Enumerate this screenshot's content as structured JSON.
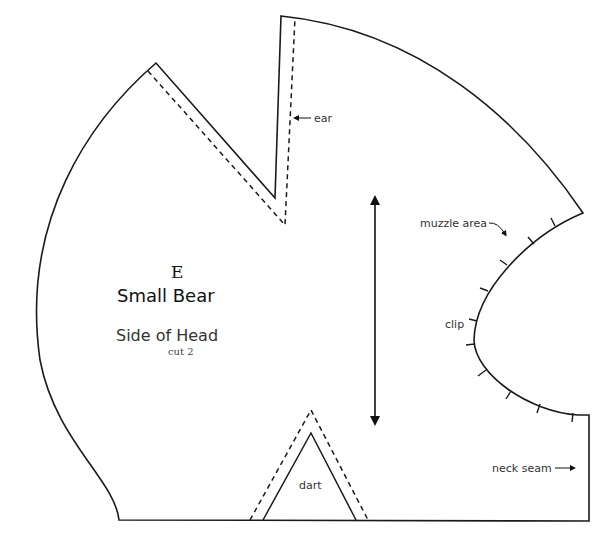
{
  "pattern": {
    "piece_letter": "E",
    "project_name": "Small Bear",
    "piece_name": "Side of Head",
    "cut_instruction": "cut 2"
  },
  "annotations": {
    "ear": "ear",
    "muzzle_area": "muzzle area",
    "clip": "clip",
    "dart": "dart",
    "neck_seam": "neck seam"
  },
  "markers": {
    "grainline": "double-headed vertical arrow",
    "clip_marks_count": 10
  },
  "colors": {
    "line": "#1a1a1a",
    "background": "#ffffff"
  }
}
